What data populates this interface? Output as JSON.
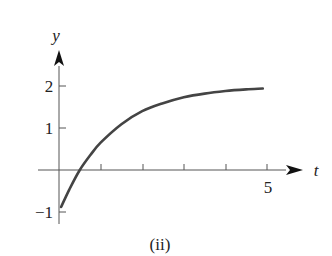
{
  "chart_data": {
    "type": "line",
    "title": "",
    "caption": "(ii)",
    "xlabel": "t",
    "ylabel": "y",
    "xlim": [
      0,
      5.4
    ],
    "ylim": [
      -1.2,
      2.5
    ],
    "x_ticks": [
      1,
      2,
      3,
      4,
      5
    ],
    "x_tick_labels": [
      "",
      "",
      "",
      "",
      "5"
    ],
    "y_ticks": [
      -1,
      1,
      2
    ],
    "y_tick_labels": [
      "−1",
      "1",
      "2"
    ],
    "grid": false,
    "legend": null,
    "series": [
      {
        "name": "y(t)",
        "color": "#444444",
        "x": [
          0.05,
          0.25,
          0.5,
          0.75,
          1.0,
          1.5,
          2.0,
          2.5,
          3.0,
          3.5,
          4.0,
          4.5,
          4.9
        ],
        "values": [
          -0.88,
          -0.46,
          0.0,
          0.35,
          0.65,
          1.09,
          1.4,
          1.59,
          1.73,
          1.82,
          1.88,
          1.92,
          1.94
        ]
      }
    ]
  },
  "labels": {
    "y_axis": "y",
    "t_axis": "t",
    "tick_2": "2",
    "tick_1": "1",
    "tick_neg1": "−1",
    "tick_5": "5",
    "caption": "(ii)"
  }
}
